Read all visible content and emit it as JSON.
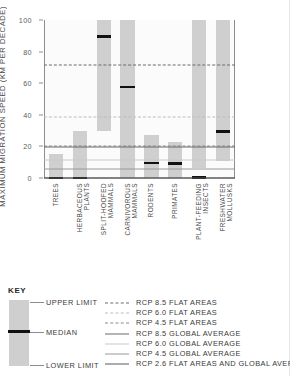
{
  "axes": {
    "left_title": "MAXIMUM MIGRATION SPEED (KM PER DECADE)",
    "right_title": "RATE OF CLIMATE ZONE SHIFT BETWEEN 2050 AND 2090 (KM PER DECADE)",
    "yticks": [
      "100",
      "80",
      "60",
      "40",
      "20",
      "0"
    ]
  },
  "key": {
    "title": "KEY",
    "upper_limit": "UPPER LIMIT",
    "median": "MEDIAN",
    "lower_limit": "LOWER LIMIT",
    "entries": [
      {
        "label": "RCP 8.5 FLAT AREAS",
        "style": "dashed",
        "color": "#6b6b6b",
        "width": 1.6
      },
      {
        "label": "RCP 6.0 FLAT AREAS",
        "style": "dashed",
        "color": "#bdbdbd",
        "width": 1.4
      },
      {
        "label": "RCP 4.5 FLAT AREAS",
        "style": "dashed",
        "color": "#8a8a8a",
        "width": 1.4
      },
      {
        "label": "RCP 8.5 GLOBAL AVERAGE",
        "style": "solid",
        "color": "#6b6b6b",
        "width": 1.5
      },
      {
        "label": "RCP 6.0 GLOBAL AVERAGE",
        "style": "solid",
        "color": "#c9c9c9",
        "width": 1.3
      },
      {
        "label": "RCP 4.5 GLOBAL AVERAGE",
        "style": "solid",
        "color": "#9a9a9a",
        "width": 1.3
      },
      {
        "label": "RCP 2.6 FLAT AREAS AND GLOBAL AVERAGE",
        "style": "solid",
        "color": "#5a5a5a",
        "width": 1.8
      }
    ]
  },
  "chart_data": {
    "type": "bar",
    "title": "",
    "xlabel": "",
    "ylabel": "MAXIMUM MIGRATION SPEED (KM PER DECADE)",
    "ylabel_right": "RATE OF CLIMATE ZONE SHIFT BETWEEN 2050 AND 2090 (KM PER DECADE)",
    "ylim": [
      0,
      100
    ],
    "yticks": [
      0,
      20,
      40,
      60,
      80,
      100
    ],
    "grid": false,
    "legend_position": "bottom",
    "bar_color": "#cfcfcf",
    "median_color": "#111111",
    "categories": [
      "TREES",
      "HERBACEOUS PLANTS",
      "SPLIT-HOOFED MAMMALS",
      "CARNIVOROUS MAMMALS",
      "RODENTS",
      "PRIMATES",
      "PLANT-FEEDING INSECTS",
      "FRESHWATER MOLLUSKS"
    ],
    "series": [
      {
        "name": "LOWER LIMIT",
        "values": [
          0.1,
          0.1,
          29.5,
          0.2,
          0.2,
          0.2,
          6.5,
          10.5
        ]
      },
      {
        "name": "MEDIAN",
        "values": [
          0.1,
          0.1,
          89.5,
          57.5,
          9.5,
          9.0,
          0.2,
          29.5
        ]
      },
      {
        "name": "UPPER LIMIT",
        "values": [
          15.0,
          29.5,
          100.0,
          100.0,
          27.5,
          22.5,
          100.0,
          100.0
        ]
      }
    ],
    "reference_lines": [
      {
        "label": "RCP 8.5 FLAT AREAS",
        "value": 71.5,
        "style": "dashed",
        "color": "#6b6b6b"
      },
      {
        "label": "RCP 6.0 FLAT AREAS",
        "value": 38.8,
        "style": "dashed",
        "color": "#bdbdbd"
      },
      {
        "label": "RCP 4.5 FLAT AREAS",
        "value": 20.4,
        "style": "dashed",
        "color": "#8a8a8a"
      },
      {
        "label": "RCP 8.5 GLOBAL AVERAGE",
        "value": 19.8,
        "style": "solid",
        "color": "#6b6b6b"
      },
      {
        "label": "RCP 6.0 GLOBAL AVERAGE",
        "value": 11.2,
        "style": "solid",
        "color": "#c9c9c9"
      },
      {
        "label": "RCP 4.5 GLOBAL AVERAGE",
        "value": 5.6,
        "style": "solid",
        "color": "#9a9a9a"
      },
      {
        "label": "RCP 2.6 FLAT AREAS AND GLOBAL AVERAGE",
        "value": 0.0,
        "style": "solid",
        "color": "#5a5a5a"
      }
    ]
  }
}
